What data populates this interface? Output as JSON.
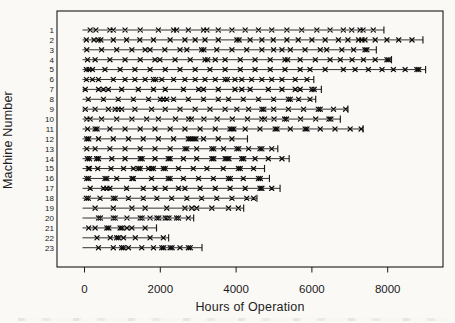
{
  "figure": {
    "background": "#faf9f6",
    "ink": "#1a1a1a"
  },
  "chart_data": {
    "type": "scatter",
    "variant": "event-recurrence-plot",
    "title": "",
    "xlabel": "Hours of Operation",
    "ylabel": "Machine Number",
    "x_ticks": [
      0,
      2000,
      4000,
      6000,
      8000
    ],
    "xlim": [
      -725,
      9460
    ],
    "grid": false,
    "legend": "none",
    "event_marker": "x",
    "end_of_observation_marker": "|",
    "machines": [
      {
        "id": "1",
        "end": 7900,
        "events": [
          150,
          300,
          670,
          760,
          1070,
          1470,
          1950,
          2350,
          2430,
          2740,
          3140,
          3230,
          3530,
          3890,
          4240,
          4590,
          4940,
          5340,
          5730,
          6130,
          6480,
          6830,
          7050,
          7270,
          7350,
          7620
        ]
      },
      {
        "id": "2",
        "end": 8930,
        "events": [
          50,
          250,
          365,
          430,
          760,
          1110,
          1460,
          1820,
          2260,
          2650,
          2920,
          3180,
          3530,
          4020,
          4080,
          4370,
          4680,
          4980,
          5340,
          5640,
          6000,
          6350,
          6700,
          6950,
          7230,
          7320,
          7400,
          7670,
          7980,
          8290,
          8640
        ]
      },
      {
        "id": "3",
        "end": 7700,
        "events": [
          60,
          450,
          850,
          1250,
          1600,
          1730,
          2120,
          2520,
          2700,
          3090,
          3150,
          3490,
          3890,
          4280,
          4680,
          4990,
          5210,
          5430,
          5820,
          6220,
          6390,
          6790,
          7100,
          7400,
          7450
        ]
      },
      {
        "id": "4",
        "end": 8100,
        "events": [
          80,
          280,
          670,
          1070,
          1470,
          1860,
          1990,
          2390,
          2790,
          3180,
          3250,
          3450,
          3710,
          4110,
          4500,
          4900,
          5290,
          5360,
          5690,
          6090,
          6480,
          6750,
          7060,
          7360,
          7670,
          7980,
          8030
        ]
      },
      {
        "id": "5",
        "end": 9000,
        "events": [
          50,
          120,
          210,
          540,
          940,
          1330,
          1730,
          2130,
          2520,
          2920,
          3310,
          3710,
          4110,
          4500,
          4900,
          5290,
          5690,
          5950,
          6350,
          6830,
          7140,
          7490,
          7850,
          8150,
          8460,
          8770,
          8820
        ]
      },
      {
        "id": "6",
        "end": 6050,
        "events": [
          50,
          210,
          370,
          760,
          1070,
          1330,
          1600,
          1820,
          1880,
          2040,
          2350,
          2650,
          2920,
          3180,
          3450,
          3710,
          3770,
          3970,
          4150,
          4410,
          4680,
          4940,
          5210,
          5560,
          5870
        ]
      },
      {
        "id": "7",
        "end": 6250,
        "events": [
          20,
          370,
          500,
          630,
          980,
          1420,
          1820,
          2130,
          2610,
          3010,
          3140,
          3530,
          3970,
          4150,
          4370,
          4850,
          5210,
          5560,
          5690,
          6000,
          6060
        ]
      },
      {
        "id": "8",
        "end": 6100,
        "events": [
          100,
          500,
          890,
          1290,
          1690,
          2000,
          2080,
          2170,
          2350,
          2740,
          3140,
          3530,
          3800,
          4190,
          4590,
          4990,
          5380,
          5430,
          5650,
          5950
        ]
      },
      {
        "id": "9",
        "end": 6950,
        "events": [
          20,
          280,
          630,
          810,
          890,
          980,
          1330,
          1770,
          2130,
          2520,
          2920,
          3310,
          3710,
          4020,
          4330,
          4680,
          4730,
          4990,
          5380,
          5780,
          6170,
          6220,
          6570,
          6890
        ]
      },
      {
        "id": "10",
        "end": 6750,
        "events": [
          60,
          150,
          450,
          850,
          1250,
          1640,
          1950,
          2400,
          2750,
          2820,
          3150,
          3500,
          3900,
          4300,
          4680,
          4750,
          5000,
          5280,
          5330,
          5700,
          6100,
          6450,
          6500
        ]
      },
      {
        "id": "11",
        "end": 7350,
        "events": [
          80,
          280,
          330,
          670,
          1070,
          1470,
          1860,
          2260,
          2650,
          3050,
          3450,
          3840,
          3890,
          3940,
          4240,
          4630,
          5030,
          5080,
          5430,
          5820,
          5870,
          6220,
          6610,
          7010,
          7300
        ]
      },
      {
        "id": "12",
        "end": 4300,
        "events": [
          60,
          110,
          370,
          760,
          1160,
          1550,
          1950,
          2350,
          2740,
          2790,
          2840,
          2890,
          2940,
          3140,
          3530,
          3890
        ]
      },
      {
        "id": "13",
        "end": 5100,
        "events": [
          60,
          280,
          670,
          1070,
          1470,
          1860,
          2260,
          2650,
          2700,
          2960,
          3360,
          3410,
          3670,
          4020,
          4070,
          4330,
          4630,
          4680,
          4940
        ]
      },
      {
        "id": "14",
        "end": 5400,
        "events": [
          75,
          130,
          320,
          370,
          720,
          1070,
          1470,
          1520,
          1860,
          2210,
          2260,
          2610,
          2960,
          3360,
          3410,
          3710,
          3760,
          3810,
          4150,
          4200,
          4500,
          4850,
          5210
        ]
      },
      {
        "id": "15",
        "end": 4750,
        "events": [
          100,
          130,
          350,
          700,
          1030,
          1290,
          1420,
          1470,
          1690,
          1770,
          1820,
          2080,
          2130,
          2480,
          2870,
          3230,
          3660,
          4060,
          4110,
          4460
        ]
      },
      {
        "id": "16",
        "end": 4880,
        "events": [
          60,
          110,
          540,
          590,
          850,
          1250,
          1290,
          1770,
          2210,
          2260,
          2610,
          3010,
          3400,
          3800,
          3850,
          4190,
          4590,
          4640
        ]
      },
      {
        "id": "17",
        "end": 5160,
        "events": [
          150,
          500,
          590,
          670,
          1110,
          1550,
          1860,
          2130,
          2480,
          2650,
          3050,
          3450,
          3840,
          4240,
          4630,
          4680,
          4940
        ]
      },
      {
        "id": "18",
        "end": 4550,
        "events": [
          50,
          100,
          410,
          760,
          810,
          1160,
          1550,
          1910,
          2300,
          2700,
          3090,
          3490,
          3890,
          4280,
          4460
        ]
      },
      {
        "id": "19",
        "end": 4200,
        "events": [
          280,
          760,
          1250,
          1600,
          2170,
          2650,
          2830,
          2960,
          3360,
          3800,
          4060
        ]
      },
      {
        "id": "20",
        "end": 2880,
        "events": [
          370,
          420,
          760,
          810,
          1120,
          1470,
          1520,
          1730,
          1910,
          1960,
          2130,
          2180,
          2230,
          2430,
          2480,
          2740
        ]
      },
      {
        "id": "21",
        "end": 1900,
        "events": [
          110,
          280,
          590,
          640,
          940,
          990,
          1120,
          1250,
          1600
        ]
      },
      {
        "id": "22",
        "end": 2220,
        "events": [
          330,
          680,
          850,
          900,
          1030,
          1340,
          1730,
          2080
        ]
      },
      {
        "id": "23",
        "end": 3100,
        "events": [
          370,
          760,
          980,
          1030,
          1160,
          1510,
          1820,
          2040,
          2090,
          2260,
          2310,
          2520,
          2740,
          2790
        ]
      }
    ]
  }
}
